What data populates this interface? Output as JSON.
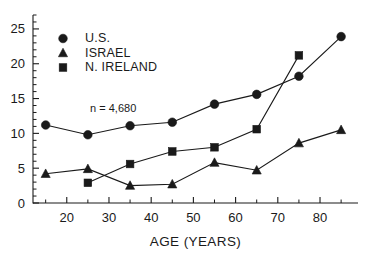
{
  "chart_data": {
    "type": "line",
    "title": "",
    "subtitle": "",
    "xlabel": "AGE (YEARS)",
    "ylabel": "",
    "xlim": [
      12,
      89
    ],
    "ylim": [
      0,
      27
    ],
    "xticks": [
      20,
      30,
      40,
      50,
      60,
      70,
      80
    ],
    "xtick_labels": [
      "20",
      "30",
      "40",
      "50",
      "60",
      "70",
      "80"
    ],
    "xminor_step": 5,
    "yticks": [
      0,
      5,
      10,
      15,
      20,
      25
    ],
    "ytick_labels": [
      "0",
      "5",
      "10",
      "15",
      "20",
      "25"
    ],
    "yminor_step": 1,
    "grid": false,
    "legend_position": "upper-left-inset",
    "annotations": [
      {
        "text": "n = 4,680",
        "x": 31,
        "y": 13.0
      }
    ],
    "x": [
      15,
      25,
      35,
      45,
      55,
      65,
      75,
      85
    ],
    "series": [
      {
        "name": "U.S.",
        "marker": "circle",
        "color": "#1a1a1a",
        "x": [
          15,
          25,
          35,
          45,
          55,
          65,
          75,
          85
        ],
        "values": [
          11.2,
          9.8,
          11.1,
          11.6,
          14.2,
          15.6,
          18.2,
          23.9
        ]
      },
      {
        "name": "ISRAEL",
        "marker": "triangle",
        "color": "#1a1a1a",
        "x": [
          15,
          25,
          35,
          45,
          55,
          65,
          75,
          85
        ],
        "values": [
          4.2,
          4.9,
          2.5,
          2.7,
          5.8,
          4.7,
          8.6,
          10.5
        ]
      },
      {
        "name": "N. IRELAND",
        "marker": "square",
        "color": "#1a1a1a",
        "x": [
          25,
          35,
          45,
          55,
          65,
          75
        ],
        "values": [
          2.9,
          5.6,
          7.4,
          8.0,
          10.6,
          21.2
        ]
      }
    ]
  },
  "legend": {
    "entries": [
      {
        "label": "U.S.",
        "marker": "circle"
      },
      {
        "label": "ISRAEL",
        "marker": "triangle"
      },
      {
        "label": "N. IRELAND",
        "marker": "square"
      }
    ]
  }
}
